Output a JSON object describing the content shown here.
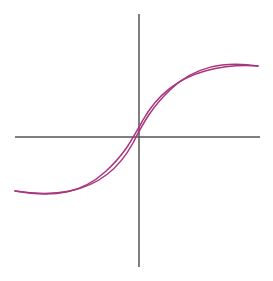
{
  "figure": {
    "title": "",
    "caption": "",
    "background_color": "#ffffff",
    "width": 273,
    "height": 281
  },
  "axes": {
    "color": "#555555",
    "stroke_width": 1.5,
    "origin": {
      "x": 139,
      "y": 137
    },
    "x_axis": {
      "label": "",
      "x_start": 15,
      "x_end": 260,
      "y": 137
    },
    "y_axis": {
      "label": "",
      "y_start": 14,
      "y_end": 267,
      "x": 139
    }
  },
  "chart_data": {
    "type": "line",
    "title": "",
    "subtitle": "",
    "xlabel": "",
    "ylabel": "",
    "grid": false,
    "legend": null,
    "legend_position": "none",
    "xlim": [
      -139,
      134
    ],
    "ylim": [
      -144,
      137
    ],
    "annotations": [],
    "curve_color": "#a8357e",
    "curve_stroke_width": 1.5,
    "saturation_tip_upper": {
      "x": 258,
      "y": 66
    },
    "saturation_tip_lower": {
      "x": 15,
      "y": 191
    },
    "coercivity_left": {
      "x": 116,
      "y": 137
    },
    "coercivity_right": {
      "x": 162,
      "y": 137
    },
    "remanence_upper": {
      "x": 139,
      "y": 120
    },
    "remanence_lower": {
      "x": 139,
      "y": 155
    },
    "series": [
      {
        "name": "ascending-branch",
        "path": "M 15 191 C 55 198 82 193 105 172 C 124 155 132 140 143 120 C 156 97 176 79 205 71 C 224 66 245 65 258 66"
      },
      {
        "name": "descending-branch",
        "path": "M 258 66 C 222 61 194 67 171 89 C 152 107 143 123 133 143 C 120 167 100 185 70 191 C 50 195 28 193 15 191"
      }
    ]
  }
}
